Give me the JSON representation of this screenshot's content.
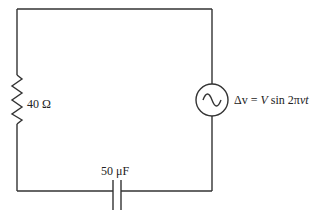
{
  "diagram": {
    "type": "circuit",
    "topology": "series RC with AC source",
    "components": [
      {
        "id": "resistor",
        "kind": "resistor",
        "label": "40 Ω",
        "position": "left branch"
      },
      {
        "id": "capacitor",
        "kind": "capacitor",
        "label": "50 μF",
        "position": "bottom branch"
      },
      {
        "id": "source",
        "kind": "ac-voltage-source",
        "label": "Δv = V sin 2πνt",
        "position": "right branch"
      }
    ],
    "labels": {
      "resistor": "40 Ω",
      "capacitor": "50 μF",
      "source_prefix": "Δv = ",
      "source_V": "V",
      "source_sin": " sin 2π",
      "source_nut": "νt"
    },
    "colors": {
      "wire": "#333333",
      "background": "#ffffff",
      "text": "#222222"
    }
  }
}
